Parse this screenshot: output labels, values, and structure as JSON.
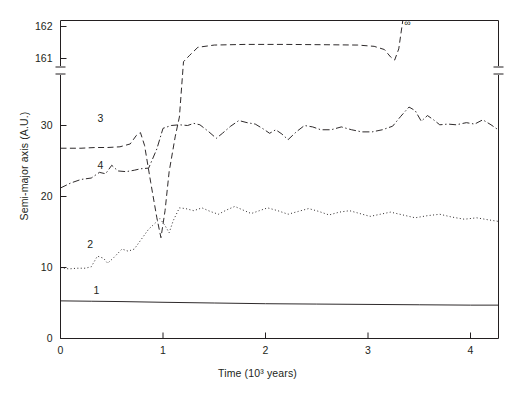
{
  "axes": {
    "ylabel": "Semi-major axis (A.U.)",
    "xlabel": "Time (10³ years)",
    "yticks": [
      "0",
      "10",
      "20",
      "30",
      "161",
      "162"
    ],
    "xticks": [
      "0",
      "1",
      "2",
      "3",
      "4"
    ],
    "y_axis_break": true,
    "corner_mark": ""
  },
  "annotations": {
    "c1": "1",
    "c2": "2",
    "c3": "3",
    "c4": "4",
    "infinity": "∞"
  },
  "colors": {
    "ink": "#231f20",
    "background": "#ffffff"
  },
  "chart_data": {
    "type": "line",
    "title": "",
    "xlabel": "Time (10³ years)",
    "ylabel": "Semi-major axis (A.U.)",
    "xlim": [
      0,
      4.27
    ],
    "ylim_lower": [
      0,
      33
    ],
    "ylim_upper": [
      160.6,
      162.2
    ],
    "axis_break": "y-axis broken between 33 and 160.6 A.U.",
    "grid": false,
    "legend": "inline curve numbers 1-4",
    "series": [
      {
        "name": "1",
        "label": "1",
        "style": "solid",
        "label_xy": [
          0.36,
          6.6
        ],
        "points": [
          [
            0.0,
            5.3
          ],
          [
            0.3,
            5.25
          ],
          [
            0.6,
            5.2
          ],
          [
            1.0,
            5.1
          ],
          [
            1.5,
            5.0
          ],
          [
            2.0,
            4.9
          ],
          [
            2.5,
            4.85
          ],
          [
            3.0,
            4.8
          ],
          [
            3.5,
            4.75
          ],
          [
            4.0,
            4.7
          ],
          [
            4.27,
            4.7
          ]
        ]
      },
      {
        "name": "2",
        "label": "2",
        "style": "dotted",
        "label_xy": [
          0.3,
          13.0
        ],
        "points": [
          [
            0.0,
            10.0
          ],
          [
            0.08,
            9.8
          ],
          [
            0.16,
            9.9
          ],
          [
            0.24,
            9.9
          ],
          [
            0.3,
            10.1
          ],
          [
            0.36,
            11.6
          ],
          [
            0.42,
            11.3
          ],
          [
            0.46,
            10.6
          ],
          [
            0.52,
            11.4
          ],
          [
            0.6,
            12.6
          ],
          [
            0.66,
            12.3
          ],
          [
            0.72,
            12.6
          ],
          [
            0.8,
            14.2
          ],
          [
            0.86,
            15.4
          ],
          [
            0.92,
            16.2
          ],
          [
            0.97,
            16.9
          ],
          [
            1.02,
            15.9
          ],
          [
            1.06,
            14.9
          ],
          [
            1.1,
            16.6
          ],
          [
            1.16,
            18.4
          ],
          [
            1.22,
            18.3
          ],
          [
            1.3,
            18.0
          ],
          [
            1.38,
            18.4
          ],
          [
            1.46,
            17.9
          ],
          [
            1.54,
            17.5
          ],
          [
            1.62,
            18.1
          ],
          [
            1.7,
            18.6
          ],
          [
            1.78,
            18.1
          ],
          [
            1.86,
            17.6
          ],
          [
            1.94,
            18.0
          ],
          [
            2.02,
            18.4
          ],
          [
            2.12,
            18.0
          ],
          [
            2.22,
            17.5
          ],
          [
            2.32,
            17.9
          ],
          [
            2.42,
            18.3
          ],
          [
            2.52,
            17.9
          ],
          [
            2.62,
            17.4
          ],
          [
            2.72,
            17.8
          ],
          [
            2.82,
            18.0
          ],
          [
            2.92,
            17.6
          ],
          [
            3.02,
            17.2
          ],
          [
            3.12,
            17.5
          ],
          [
            3.22,
            17.8
          ],
          [
            3.34,
            17.4
          ],
          [
            3.46,
            17.0
          ],
          [
            3.58,
            17.3
          ],
          [
            3.7,
            17.5
          ],
          [
            3.82,
            17.1
          ],
          [
            3.94,
            16.8
          ],
          [
            4.06,
            17.0
          ],
          [
            4.18,
            16.7
          ],
          [
            4.27,
            16.5
          ]
        ]
      },
      {
        "name": "3",
        "label": "3",
        "style": "dashed",
        "label_xy": [
          0.4,
          30.8
        ],
        "note": "plateaus at 161.4 A.U. from t=1.35 to t=3.2, then escapes to infinity at t=3.35",
        "points": [
          [
            0.0,
            26.8
          ],
          [
            0.2,
            26.8
          ],
          [
            0.34,
            26.9
          ],
          [
            0.46,
            26.9
          ],
          [
            0.58,
            27.0
          ],
          [
            0.68,
            27.4
          ],
          [
            0.74,
            28.6
          ],
          [
            0.78,
            29.0
          ],
          [
            0.82,
            27.2
          ],
          [
            0.88,
            22.0
          ],
          [
            0.94,
            17.0
          ],
          [
            0.98,
            14.2
          ],
          [
            1.02,
            18.0
          ],
          [
            1.06,
            23.5
          ],
          [
            1.12,
            28.5
          ],
          [
            1.16,
            31.2
          ],
          [
            1.2,
            160.9
          ],
          [
            1.26,
            161.1
          ],
          [
            1.34,
            161.35
          ],
          [
            1.5,
            161.42
          ],
          [
            1.8,
            161.44
          ],
          [
            2.2,
            161.44
          ],
          [
            2.6,
            161.43
          ],
          [
            2.9,
            161.42
          ],
          [
            3.06,
            161.38
          ],
          [
            3.16,
            161.28
          ],
          [
            3.22,
            161.05
          ],
          [
            3.26,
            160.95
          ],
          [
            3.3,
            161.3
          ],
          [
            3.34,
            162.2
          ]
        ]
      },
      {
        "name": "4",
        "label": "4",
        "style": "dashdot",
        "label_xy": [
          0.4,
          24.1
        ],
        "points": [
          [
            0.0,
            21.2
          ],
          [
            0.1,
            21.9
          ],
          [
            0.2,
            22.4
          ],
          [
            0.3,
            22.6
          ],
          [
            0.38,
            23.4
          ],
          [
            0.44,
            23.2
          ],
          [
            0.5,
            24.4
          ],
          [
            0.56,
            23.6
          ],
          [
            0.64,
            23.5
          ],
          [
            0.72,
            23.7
          ],
          [
            0.78,
            23.9
          ],
          [
            0.86,
            24.0
          ],
          [
            0.94,
            26.7
          ],
          [
            1.0,
            29.6
          ],
          [
            1.08,
            30.0
          ],
          [
            1.16,
            30.1
          ],
          [
            1.24,
            30.0
          ],
          [
            1.3,
            30.3
          ],
          [
            1.36,
            30.1
          ],
          [
            1.44,
            29.2
          ],
          [
            1.52,
            28.2
          ],
          [
            1.58,
            28.9
          ],
          [
            1.66,
            29.9
          ],
          [
            1.74,
            30.7
          ],
          [
            1.82,
            30.4
          ],
          [
            1.9,
            30.2
          ],
          [
            1.98,
            29.5
          ],
          [
            2.04,
            28.9
          ],
          [
            2.1,
            29.4
          ],
          [
            2.16,
            28.8
          ],
          [
            2.22,
            28.0
          ],
          [
            2.3,
            29.1
          ],
          [
            2.38,
            30.0
          ],
          [
            2.46,
            29.8
          ],
          [
            2.54,
            29.4
          ],
          [
            2.64,
            29.4
          ],
          [
            2.74,
            29.8
          ],
          [
            2.84,
            29.4
          ],
          [
            2.94,
            29.1
          ],
          [
            3.04,
            29.1
          ],
          [
            3.14,
            29.4
          ],
          [
            3.24,
            29.9
          ],
          [
            3.32,
            31.3
          ],
          [
            3.4,
            32.6
          ],
          [
            3.46,
            32.1
          ],
          [
            3.52,
            30.6
          ],
          [
            3.58,
            31.4
          ],
          [
            3.64,
            30.8
          ],
          [
            3.7,
            30.1
          ],
          [
            3.78,
            30.2
          ],
          [
            3.86,
            30.1
          ],
          [
            3.96,
            30.4
          ],
          [
            4.04,
            30.2
          ],
          [
            4.12,
            30.8
          ],
          [
            4.2,
            30.1
          ],
          [
            4.27,
            29.4
          ]
        ]
      }
    ]
  }
}
